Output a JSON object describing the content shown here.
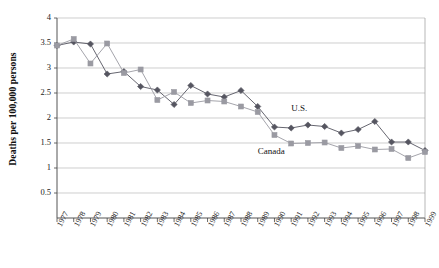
{
  "chart_data": {
    "type": "line",
    "title": "",
    "xlabel": "",
    "ylabel": "Deaths per 100,000 persons",
    "ylim": [
      0,
      4
    ],
    "yticks": [
      "0.5",
      "1",
      "1.5",
      "2",
      "2.5",
      "3",
      "3.5",
      "4"
    ],
    "ytick_values": [
      0.5,
      1,
      1.5,
      2,
      2.5,
      3,
      3.5,
      4
    ],
    "grid": true,
    "legend": "inline-annotations",
    "categories": [
      "1977",
      "1978",
      "1979",
      "1980",
      "1981",
      "1982",
      "1983",
      "1984",
      "1985",
      "1986",
      "1987",
      "1988",
      "1989",
      "1990",
      "1991",
      "1992",
      "1993",
      "1994",
      "1995",
      "1996",
      "1997",
      "1998",
      "1999"
    ],
    "series": [
      {
        "name": "U.S.",
        "marker": "diamond",
        "color": "#555560",
        "values": [
          3.45,
          3.52,
          3.48,
          2.88,
          2.93,
          2.63,
          2.56,
          2.27,
          2.65,
          2.48,
          2.42,
          2.55,
          2.23,
          1.82,
          1.8,
          1.86,
          1.83,
          1.7,
          1.77,
          1.93,
          1.52,
          1.52,
          1.35
        ]
      },
      {
        "name": "Canada",
        "marker": "square",
        "color": "#9a9aa2",
        "values": [
          3.45,
          3.58,
          3.09,
          3.49,
          2.9,
          2.97,
          2.36,
          2.52,
          2.3,
          2.35,
          2.33,
          2.23,
          2.12,
          1.66,
          1.49,
          1.5,
          1.51,
          1.4,
          1.44,
          1.37,
          1.38,
          1.2,
          1.32
        ]
      }
    ],
    "annotations": [
      {
        "text": "U.S.",
        "x_year": "1991",
        "y_value": 2.18
      },
      {
        "text": "Canada",
        "x_year": "1989",
        "y_value": 1.32
      }
    ]
  },
  "axis": {
    "y_title": "Deaths per 100,000 persons"
  }
}
